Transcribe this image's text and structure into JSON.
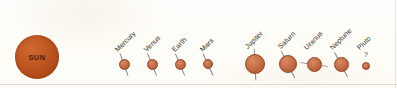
{
  "figure": {
    "background_color": "#fffdf8",
    "sun": {
      "label": "SUN",
      "color": "#bd5520",
      "center_x": 37,
      "center_y": 57,
      "radius": 22
    },
    "planet_body_color": "#c87249",
    "planet_outline_color": "#8f4526",
    "axis_line_color": "#7d8187",
    "label_color": "#2e2c28",
    "label_rotation_deg": -45,
    "pluto_marker": "?"
  },
  "planets": [
    {
      "name": "Mercury",
      "label": "Mercury",
      "center_x": 124,
      "center_y": 64,
      "radius": 5.5,
      "axis_tilt_deg": 20,
      "axis_length": 24,
      "label_x": 116,
      "label_y": 47,
      "has_axis": true,
      "has_question_mark": false
    },
    {
      "name": "Venus",
      "label": "Venus",
      "center_x": 152,
      "center_y": 64,
      "radius": 5.5,
      "axis_tilt_deg": 22,
      "axis_length": 24,
      "label_x": 145,
      "label_y": 47,
      "has_axis": true,
      "has_question_mark": false
    },
    {
      "name": "Earth",
      "label": "Earth",
      "center_x": 180,
      "center_y": 64,
      "radius": 5.5,
      "axis_tilt_deg": 23,
      "axis_length": 24,
      "label_x": 173,
      "label_y": 47,
      "has_axis": true,
      "has_question_mark": false
    },
    {
      "name": "Mars",
      "label": "Mars",
      "center_x": 208,
      "center_y": 64,
      "radius": 5,
      "axis_tilt_deg": 25,
      "axis_length": 24,
      "label_x": 201,
      "label_y": 47,
      "has_axis": true,
      "has_question_mark": false
    },
    {
      "name": "Jupiter",
      "label": "Jupiter",
      "center_x": 255,
      "center_y": 64,
      "radius": 10,
      "axis_tilt_deg": 3,
      "axis_length": 32,
      "label_x": 246,
      "label_y": 44,
      "has_axis": true,
      "has_question_mark": false
    },
    {
      "name": "Saturn",
      "label": "Saturn",
      "center_x": 288,
      "center_y": 64,
      "radius": 9,
      "axis_tilt_deg": 27,
      "axis_length": 30,
      "label_x": 279,
      "label_y": 44,
      "has_axis": true,
      "has_question_mark": false
    },
    {
      "name": "Uranus",
      "label": "Uranus",
      "center_x": 314,
      "center_y": 64,
      "radius": 7.5,
      "axis_tilt_deg": 82,
      "axis_length": 28,
      "label_x": 305,
      "label_y": 45,
      "has_axis": true,
      "has_question_mark": false
    },
    {
      "name": "Neptune",
      "label": "Neptune",
      "center_x": 341,
      "center_y": 64,
      "radius": 7.5,
      "axis_tilt_deg": 28,
      "axis_length": 28,
      "label_x": 331,
      "label_y": 45,
      "has_axis": true,
      "has_question_mark": false
    },
    {
      "name": "Pluto",
      "label": "Pluto",
      "center_x": 366,
      "center_y": 66,
      "radius": 4,
      "axis_tilt_deg": 0,
      "axis_length": 0,
      "label_x": 358,
      "label_y": 45,
      "has_axis": false,
      "has_question_mark": true
    }
  ]
}
